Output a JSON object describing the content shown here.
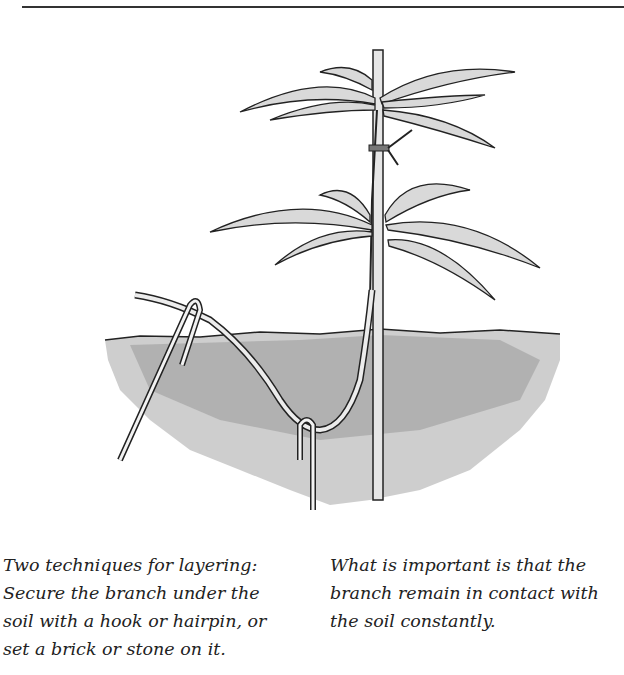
{
  "page": {
    "illustration": {
      "subject": "plant layering illustration",
      "elements": [
        "plant-stem",
        "support-stake",
        "leaves",
        "tie",
        "soil",
        "layered-branch",
        "hairpin-hook",
        "hook-left"
      ]
    },
    "captions": {
      "left": {
        "lines": [
          "Two techniques for layering:",
          "Secure the branch under the",
          "soil with a hook or hairpin, or",
          "set a brick or stone on it."
        ]
      },
      "right": {
        "lines": [
          "What is important is that the",
          "branch remain in contact with",
          "the soil constantly."
        ]
      }
    }
  }
}
